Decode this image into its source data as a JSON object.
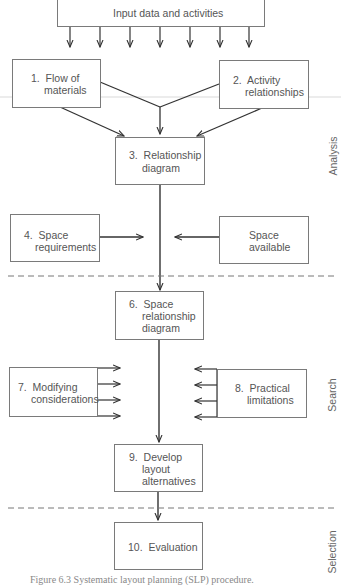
{
  "diagram": {
    "top_box": {
      "label": "Input data and activities"
    },
    "steps": [
      {
        "id": "1",
        "line1": "1.  Flow of",
        "line2": "materials"
      },
      {
        "id": "2",
        "line1": "2.  Activity",
        "line2": "relationships"
      },
      {
        "id": "3",
        "line1": "3.  Relationship",
        "line2": "diagram"
      },
      {
        "id": "4",
        "line1": "4.  Space",
        "line2": "requirements"
      },
      {
        "id": "5",
        "line1": "Space",
        "line2": "available"
      },
      {
        "id": "6",
        "line1": "6.  Space",
        "line2": "relationship",
        "line3": "diagram"
      },
      {
        "id": "7",
        "line1": "7.  Modifying",
        "line2": "considerations"
      },
      {
        "id": "8",
        "line1": "8.  Practical",
        "line2": "limitations"
      },
      {
        "id": "9",
        "line1": "9.  Develop",
        "line2": "layout",
        "line3": "alternatives"
      },
      {
        "id": "10",
        "line1": "10.  Evaluation"
      }
    ],
    "phases": [
      {
        "label": "Analysis"
      },
      {
        "label": "Search"
      },
      {
        "label": "Selection"
      }
    ],
    "caption": "Figure 6.3   Systematic layout planning (SLP) procedure.",
    "colors": {
      "line": "#333333",
      "box_border": "#7a7a7a",
      "dashed": "#777777",
      "text": "#555555"
    }
  }
}
